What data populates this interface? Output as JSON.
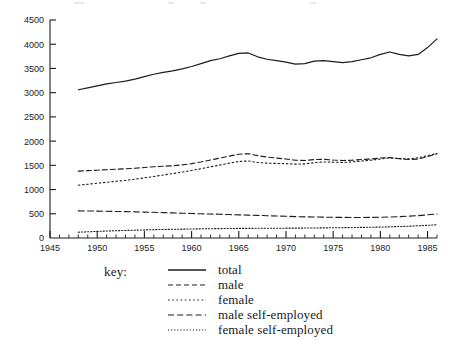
{
  "chart_data": {
    "type": "line",
    "title": "",
    "subtitle": "",
    "xlabel": "",
    "ylabel": "",
    "xlim": [
      1945,
      1986
    ],
    "ylim": [
      0,
      4500
    ],
    "grid": false,
    "legend_position": "below",
    "y_ticks": [
      0,
      500,
      1000,
      1500,
      2000,
      2500,
      3000,
      3500,
      4000,
      4500
    ],
    "y_tick_labels": [
      "0",
      "500",
      "1000",
      "1500",
      "2000",
      "2500",
      "3000",
      "3500",
      "4000",
      "4500"
    ],
    "x_ticks": [
      1945,
      1950,
      1955,
      1960,
      1965,
      1970,
      1975,
      1980,
      1985
    ],
    "x_tick_labels": [
      "1945",
      "1950",
      "1955",
      "1960",
      "1965",
      "1970",
      "1975",
      "1980",
      "1985"
    ],
    "x_minor_tick_step": 1,
    "x": [
      1948,
      1949,
      1950,
      1951,
      1952,
      1953,
      1954,
      1955,
      1956,
      1957,
      1958,
      1959,
      1960,
      1961,
      1962,
      1963,
      1964,
      1965,
      1966,
      1967,
      1968,
      1969,
      1970,
      1971,
      1972,
      1973,
      1974,
      1975,
      1976,
      1977,
      1978,
      1979,
      1980,
      1981,
      1982,
      1983,
      1984,
      1985,
      1986
    ],
    "series": [
      {
        "name": "total",
        "style": "solid",
        "values": [
          3060,
          3100,
          3140,
          3180,
          3210,
          3240,
          3280,
          3330,
          3380,
          3420,
          3450,
          3490,
          3540,
          3600,
          3660,
          3700,
          3760,
          3810,
          3820,
          3740,
          3690,
          3660,
          3630,
          3590,
          3600,
          3650,
          3660,
          3640,
          3620,
          3640,
          3680,
          3720,
          3790,
          3840,
          3790,
          3760,
          3790,
          3930,
          4110
        ]
      },
      {
        "name": "male",
        "style": "dashed",
        "values": [
          1380,
          1390,
          1400,
          1410,
          1420,
          1430,
          1440,
          1455,
          1470,
          1480,
          1490,
          1510,
          1535,
          1570,
          1610,
          1650,
          1690,
          1730,
          1740,
          1700,
          1670,
          1650,
          1630,
          1605,
          1600,
          1620,
          1625,
          1610,
          1600,
          1605,
          1620,
          1630,
          1650,
          1660,
          1635,
          1620,
          1630,
          1680,
          1740
        ]
      },
      {
        "name": "female",
        "style": "dotted",
        "values": [
          1090,
          1110,
          1130,
          1150,
          1170,
          1190,
          1215,
          1240,
          1270,
          1300,
          1330,
          1360,
          1395,
          1430,
          1470,
          1505,
          1545,
          1580,
          1590,
          1560,
          1545,
          1540,
          1535,
          1525,
          1530,
          1555,
          1570,
          1565,
          1560,
          1570,
          1590,
          1605,
          1630,
          1655,
          1640,
          1635,
          1655,
          1700,
          1745
        ]
      },
      {
        "name": "male self-employed",
        "style": "longdash",
        "values": [
          560,
          558,
          555,
          552,
          548,
          545,
          540,
          535,
          530,
          524,
          518,
          512,
          506,
          500,
          495,
          490,
          484,
          478,
          472,
          466,
          460,
          454,
          448,
          442,
          437,
          433,
          430,
          427,
          425,
          424,
          424,
          425,
          428,
          433,
          440,
          450,
          462,
          478,
          495
        ]
      },
      {
        "name": "female self-employed",
        "style": "fine-dotted",
        "values": [
          120,
          128,
          136,
          144,
          150,
          156,
          162,
          167,
          172,
          176,
          180,
          183,
          186,
          189,
          192,
          194,
          196,
          198,
          199,
          200,
          201,
          202,
          203,
          204,
          205,
          207,
          209,
          211,
          213,
          216,
          219,
          222,
          226,
          231,
          237,
          244,
          252,
          262,
          274
        ]
      }
    ]
  },
  "legend": {
    "key_label": "key:",
    "entries": [
      {
        "label": "total",
        "style": "solid"
      },
      {
        "label": "male",
        "style": "dashed"
      },
      {
        "label": "female",
        "style": "dotted"
      },
      {
        "label": "male self-employed",
        "style": "longdash"
      },
      {
        "label": "female self-employed",
        "style": "fine-dotted"
      }
    ]
  },
  "colors": {
    "ink": "#1d1d1d",
    "background": "#ffffff"
  }
}
